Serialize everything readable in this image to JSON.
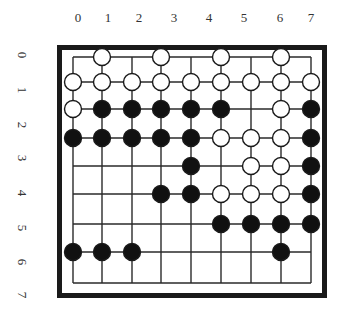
{
  "board": {
    "column_labels": [
      "0",
      "1",
      "2",
      "3",
      "4",
      "5",
      "6",
      "7"
    ],
    "row_labels": [
      "0",
      "1",
      "2",
      "3",
      "4",
      "5",
      "6",
      "7"
    ],
    "grid": {
      "columns_x": [
        73,
        102,
        132,
        161,
        191,
        221,
        251,
        281,
        311
      ],
      "rows_y": [
        57,
        82,
        109,
        138,
        166,
        194,
        224,
        252,
        283
      ]
    },
    "colors": {
      "line": "#2a2a2a",
      "black_stone": "#111111",
      "white_stone": "#ffffff",
      "frame": "#1a1a1a"
    },
    "stones": [
      {
        "c": 1,
        "r": 0,
        "color": "white"
      },
      {
        "c": 3,
        "r": 0,
        "color": "white"
      },
      {
        "c": 5,
        "r": 0,
        "color": "white"
      },
      {
        "c": 7,
        "r": 0,
        "color": "white"
      },
      {
        "c": 0,
        "r": 1,
        "color": "white"
      },
      {
        "c": 1,
        "r": 1,
        "color": "white"
      },
      {
        "c": 2,
        "r": 1,
        "color": "white"
      },
      {
        "c": 3,
        "r": 1,
        "color": "white"
      },
      {
        "c": 4,
        "r": 1,
        "color": "white"
      },
      {
        "c": 5,
        "r": 1,
        "color": "white"
      },
      {
        "c": 6,
        "r": 1,
        "color": "white"
      },
      {
        "c": 7,
        "r": 1,
        "color": "white"
      },
      {
        "c": 8,
        "r": 1,
        "color": "white"
      },
      {
        "c": 0,
        "r": 2,
        "color": "white"
      },
      {
        "c": 1,
        "r": 2,
        "color": "black"
      },
      {
        "c": 2,
        "r": 2,
        "color": "black"
      },
      {
        "c": 3,
        "r": 2,
        "color": "black"
      },
      {
        "c": 4,
        "r": 2,
        "color": "black"
      },
      {
        "c": 5,
        "r": 2,
        "color": "black"
      },
      {
        "c": 7,
        "r": 2,
        "color": "white"
      },
      {
        "c": 8,
        "r": 2,
        "color": "black"
      },
      {
        "c": 0,
        "r": 3,
        "color": "black"
      },
      {
        "c": 1,
        "r": 3,
        "color": "black"
      },
      {
        "c": 2,
        "r": 3,
        "color": "black"
      },
      {
        "c": 3,
        "r": 3,
        "color": "black"
      },
      {
        "c": 4,
        "r": 3,
        "color": "black"
      },
      {
        "c": 5,
        "r": 3,
        "color": "white"
      },
      {
        "c": 6,
        "r": 3,
        "color": "white"
      },
      {
        "c": 7,
        "r": 3,
        "color": "white"
      },
      {
        "c": 8,
        "r": 3,
        "color": "black"
      },
      {
        "c": 4,
        "r": 4,
        "color": "black"
      },
      {
        "c": 6,
        "r": 4,
        "color": "white"
      },
      {
        "c": 7,
        "r": 4,
        "color": "white"
      },
      {
        "c": 8,
        "r": 4,
        "color": "black"
      },
      {
        "c": 3,
        "r": 5,
        "color": "black"
      },
      {
        "c": 4,
        "r": 5,
        "color": "black"
      },
      {
        "c": 5,
        "r": 5,
        "color": "white"
      },
      {
        "c": 6,
        "r": 5,
        "color": "white"
      },
      {
        "c": 7,
        "r": 5,
        "color": "white"
      },
      {
        "c": 8,
        "r": 5,
        "color": "black"
      },
      {
        "c": 5,
        "r": 6,
        "color": "black"
      },
      {
        "c": 6,
        "r": 6,
        "color": "black"
      },
      {
        "c": 7,
        "r": 6,
        "color": "black"
      },
      {
        "c": 8,
        "r": 6,
        "color": "black"
      },
      {
        "c": 0,
        "r": 7,
        "color": "black"
      },
      {
        "c": 1,
        "r": 7,
        "color": "black"
      },
      {
        "c": 2,
        "r": 7,
        "color": "black"
      },
      {
        "c": 7,
        "r": 7,
        "color": "black"
      }
    ]
  }
}
